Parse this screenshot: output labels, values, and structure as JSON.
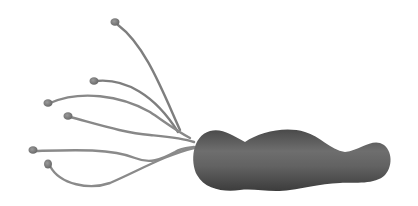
{
  "illustration": {
    "subject": "bacterium with flagella",
    "colors": {
      "background": "#ffffff",
      "body": "#5a5a5a",
      "body_highlight": "#7a7a7a",
      "body_shadow": "#3e3e3e",
      "flagellum": "#8a8a8a",
      "flagellum_tip": "#7c7c7c"
    },
    "flagella_count": 6
  }
}
